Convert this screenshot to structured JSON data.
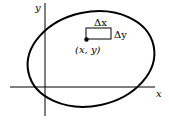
{
  "diagram": {
    "axis_labels": {
      "x": "x",
      "y": "y"
    },
    "delta_x": "Δx",
    "delta_y": "Δy",
    "point_label": "(x, y)",
    "colors": {
      "stroke": "#000000",
      "background": "#ffffff"
    }
  }
}
